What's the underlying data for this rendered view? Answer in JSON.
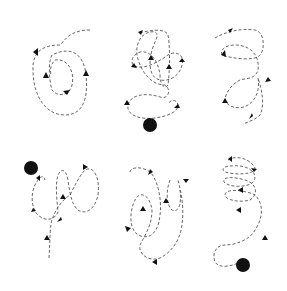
{
  "diagram": {
    "colors": {
      "background": "#ffffff",
      "path": "#555555",
      "marker": "#111111"
    },
    "panels": [
      {
        "id": "top-left",
        "has_ball": false,
        "arrow_count": 4
      },
      {
        "id": "top-middle",
        "has_ball": true,
        "arrow_count": 6
      },
      {
        "id": "top-right",
        "has_ball": false,
        "arrow_count": 5
      },
      {
        "id": "bottom-left",
        "has_ball": true,
        "arrow_count": 5
      },
      {
        "id": "bottom-middle",
        "has_ball": false,
        "arrow_count": 5
      },
      {
        "id": "bottom-right",
        "has_ball": true,
        "arrow_count": 5
      }
    ]
  }
}
